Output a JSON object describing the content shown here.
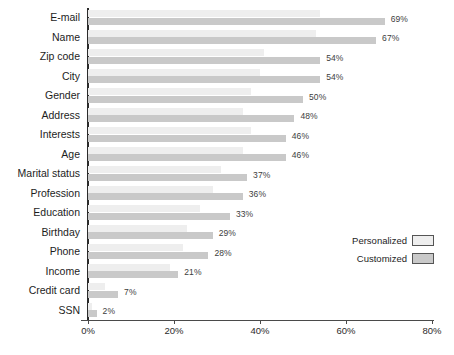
{
  "chart_data": {
    "type": "bar",
    "orientation": "horizontal",
    "title": "",
    "subtitle": "",
    "xlabel": "",
    "ylabel": "",
    "xlim": [
      0,
      80
    ],
    "xtick_labels": [
      "0%",
      "20%",
      "40%",
      "60%",
      "80%"
    ],
    "xticks": [
      0,
      20,
      40,
      60,
      80
    ],
    "grid": false,
    "legend_position": "middle-right",
    "categories": [
      "E-mail",
      "Name",
      "Zip code",
      "City",
      "Gender",
      "Address",
      "Interests",
      "Age",
      "Marital status",
      "Profession",
      "Education",
      "Birthday",
      "Phone",
      "Income",
      "Credit card",
      "SSN"
    ],
    "series": [
      {
        "name": "Personalized",
        "color": "#eeeeee",
        "values": [
          54,
          53,
          41,
          40,
          38,
          36,
          38,
          36,
          31,
          29,
          26,
          23,
          22,
          19,
          4,
          1
        ],
        "labels_shown": false
      },
      {
        "name": "Customized",
        "color": "#c9c9c9",
        "values": [
          69,
          67,
          54,
          54,
          50,
          48,
          46,
          46,
          37,
          36,
          33,
          29,
          28,
          21,
          7,
          2
        ],
        "value_labels": [
          "69%",
          "67%",
          "54%",
          "54%",
          "50%",
          "48%",
          "46%",
          "46%",
          "37%",
          "36%",
          "33%",
          "29%",
          "28%",
          "21%",
          "7%",
          "2%"
        ],
        "labels_shown": true
      }
    ]
  },
  "legend": {
    "items": [
      {
        "label": "Personalized",
        "color": "#eeeeee"
      },
      {
        "label": "Customized",
        "color": "#c9c9c9"
      }
    ]
  }
}
